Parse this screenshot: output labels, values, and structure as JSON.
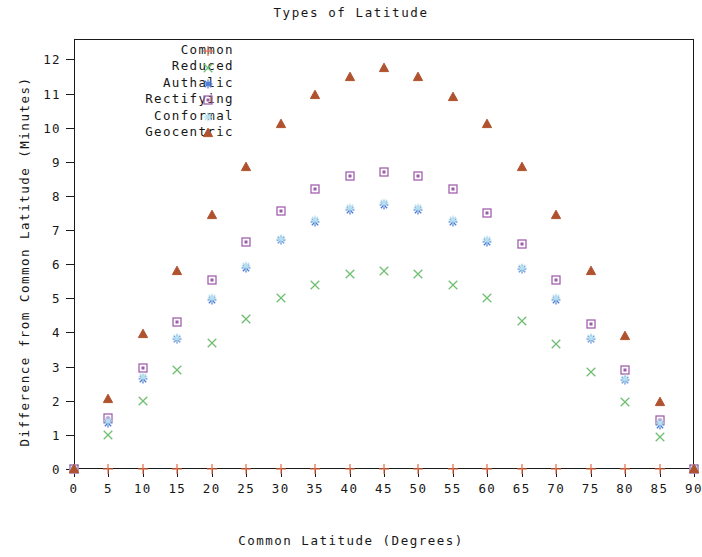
{
  "chart_data": {
    "type": "scatter",
    "title": "Types of Latitude",
    "xlabel": "Common Latitude (Degrees)",
    "ylabel": "Difference from Common Latitude (Minutes)",
    "xlim": [
      0,
      90
    ],
    "ylim": [
      0,
      12.6
    ],
    "xticks": [
      0,
      5,
      10,
      15,
      20,
      25,
      30,
      35,
      40,
      45,
      50,
      55,
      60,
      65,
      70,
      75,
      80,
      85,
      90
    ],
    "yticks": [
      0,
      1,
      2,
      3,
      4,
      5,
      6,
      7,
      8,
      9,
      10,
      11,
      12
    ],
    "grid": false,
    "legend_position": "upper left",
    "x": [
      0,
      5,
      10,
      15,
      20,
      25,
      30,
      35,
      40,
      45,
      50,
      55,
      60,
      65,
      70,
      75,
      80,
      85,
      90
    ],
    "series": [
      {
        "name": "Common",
        "marker": "plus",
        "color": "#e8714a",
        "values": [
          0,
          0,
          0,
          0,
          0,
          0,
          0,
          0,
          0,
          0,
          0,
          0,
          0,
          0,
          0,
          0,
          0,
          0,
          0
        ]
      },
      {
        "name": "Reduced",
        "marker": "cross",
        "color": "#6fbf73",
        "values": [
          0,
          1.0,
          2.0,
          2.9,
          3.7,
          4.4,
          5.0,
          5.4,
          5.7,
          5.8,
          5.7,
          5.4,
          5.0,
          4.35,
          3.65,
          2.85,
          1.95,
          0.95,
          0
        ]
      },
      {
        "name": "Authalic",
        "marker": "asterisk",
        "color": "#4d79d6",
        "values": [
          0,
          1.35,
          2.65,
          3.8,
          4.95,
          5.9,
          6.7,
          7.25,
          7.6,
          7.75,
          7.6,
          7.25,
          6.65,
          5.85,
          4.95,
          3.8,
          2.6,
          1.3,
          0
        ]
      },
      {
        "name": "Rectifying",
        "marker": "square",
        "color": "#9c5ba8",
        "values": [
          0,
          1.5,
          2.95,
          4.3,
          5.55,
          6.65,
          7.55,
          8.2,
          8.6,
          8.7,
          8.6,
          8.2,
          7.5,
          6.6,
          5.55,
          4.25,
          2.9,
          1.45,
          0
        ]
      },
      {
        "name": "Conformal",
        "marker": "star",
        "color": "#b9e2ef",
        "values": [
          0,
          1.4,
          2.7,
          3.85,
          5.0,
          5.95,
          6.75,
          7.3,
          7.65,
          7.78,
          7.65,
          7.3,
          6.7,
          5.9,
          5.0,
          3.85,
          2.65,
          1.35,
          0
        ]
      },
      {
        "name": "Geocentric",
        "marker": "triangle",
        "color": "#b0522e",
        "values": [
          0,
          2.05,
          3.95,
          5.8,
          7.45,
          8.85,
          10.1,
          10.95,
          11.5,
          11.75,
          11.5,
          10.9,
          10.1,
          8.85,
          7.45,
          5.8,
          3.9,
          1.95,
          0
        ]
      }
    ]
  }
}
